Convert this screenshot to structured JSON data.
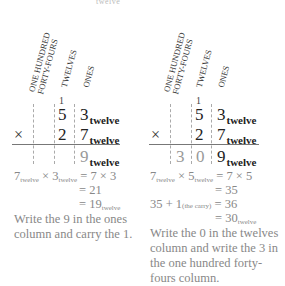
{
  "headers": {
    "hundred_forty_fours": [
      "ONE HUNDRED",
      "FORTY-FOURS"
    ],
    "twelves": "TWELVES",
    "ones": "ONES"
  },
  "top_cut_text": "twelve",
  "base_label": "twelve",
  "operator": "×",
  "left": {
    "carry": "1",
    "top_row": {
      "twelves": "5",
      "ones": "3"
    },
    "bottom_row": {
      "twelves": "2",
      "ones": "7"
    },
    "result": {
      "ones": "9"
    },
    "equations": [
      {
        "lhs_a": "7",
        "lhs_b": "3",
        "rhs": "= 7 × 3"
      },
      {
        "rhs": "= 21"
      },
      {
        "rhs": "= 19",
        "sub": "twelve"
      }
    ],
    "note": "Write the 9 in the ones column and carry the 1."
  },
  "right": {
    "carry": "1",
    "top_row": {
      "twelves": "5",
      "ones": "3"
    },
    "bottom_row": {
      "twelves": "2",
      "ones": "7"
    },
    "result": {
      "hundred_forty_fours": "3",
      "twelves": "0",
      "ones": "9"
    },
    "equations": [
      {
        "lhs_a": "7",
        "lhs_b": "5",
        "rhs": "= 7 × 5"
      },
      {
        "rhs": "= 35"
      },
      {
        "lhs": "35 + 1",
        "lhs_note": "(the carry)",
        "rhs": "= 36"
      },
      {
        "rhs": "= 30",
        "sub": "twelve"
      }
    ],
    "note": "Write the 0 in the twelves column and write the 3 in the one hundred forty-fours column."
  },
  "colors": {
    "text": "#222222",
    "muted": "#888888",
    "guide": "#aaaaaa",
    "rule": "#777777"
  }
}
